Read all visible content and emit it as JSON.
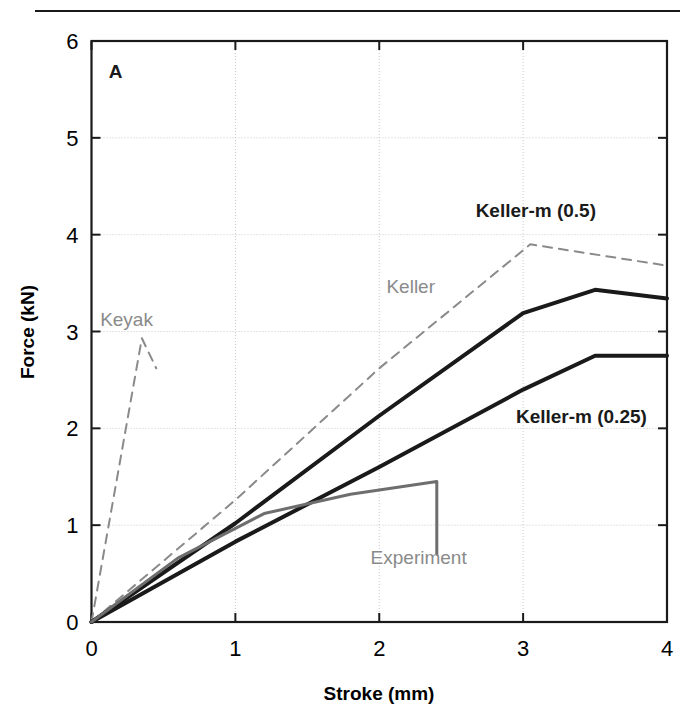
{
  "figure": {
    "panel_label": "A",
    "has_top_rule": true,
    "background_color": "#ffffff"
  },
  "chart_data": {
    "type": "line",
    "title": "",
    "subtitle": "",
    "xlabel": "Stroke (mm)",
    "ylabel": "Force (kN)",
    "xlim": [
      0,
      4
    ],
    "ylim": [
      0,
      6
    ],
    "xticks": [
      "0",
      "1",
      "2",
      "3",
      "4"
    ],
    "xtick_values": [
      0,
      1,
      2,
      3,
      4
    ],
    "yticks": [
      "0",
      "1",
      "2",
      "3",
      "4",
      "5",
      "6"
    ],
    "ytick_values": [
      0,
      1,
      2,
      3,
      4,
      5,
      6
    ],
    "grid": true,
    "grid_style": "dotted",
    "legend": "inline-annotations",
    "annotations": [
      {
        "text": "A",
        "x": 0.12,
        "y": 5.62,
        "style": "bold-dark"
      },
      {
        "text": "Keyak",
        "x": 0.06,
        "y": 3.06,
        "style": "gray"
      },
      {
        "text": "Keller",
        "x": 2.05,
        "y": 3.4,
        "style": "gray"
      },
      {
        "text": "Keller-m (0.5)",
        "x": 2.67,
        "y": 4.18,
        "style": "bold-dark"
      },
      {
        "text": "Keller-m (0.25)",
        "x": 2.95,
        "y": 2.05,
        "style": "bold-dark"
      },
      {
        "text": "Experiment",
        "x": 1.94,
        "y": 0.6,
        "style": "gray"
      }
    ],
    "series": [
      {
        "name": "Keyak",
        "color": "#8a8a8a",
        "line_style": "dashed",
        "line_width": 2,
        "points": [
          [
            0,
            0
          ],
          [
            0.35,
            2.93
          ],
          [
            0.45,
            2.62
          ]
        ]
      },
      {
        "name": "Keller",
        "color": "#8a8a8a",
        "line_style": "dashed",
        "line_width": 2,
        "points": [
          [
            0,
            0
          ],
          [
            1.0,
            1.26
          ],
          [
            2.0,
            2.62
          ],
          [
            3.05,
            3.9
          ],
          [
            4.0,
            3.68
          ]
        ]
      },
      {
        "name": "Keller-m (0.5)",
        "color": "#1a1a1a",
        "line_style": "solid",
        "line_width": 4,
        "points": [
          [
            0,
            0
          ],
          [
            1.0,
            1.02
          ],
          [
            2.0,
            2.13
          ],
          [
            3.0,
            3.19
          ],
          [
            3.5,
            3.43
          ],
          [
            4.0,
            3.34
          ]
        ]
      },
      {
        "name": "Keller-m (0.25)",
        "color": "#1a1a1a",
        "line_style": "solid",
        "line_width": 4,
        "points": [
          [
            0,
            0
          ],
          [
            1.0,
            0.83
          ],
          [
            2.0,
            1.6
          ],
          [
            3.0,
            2.4
          ],
          [
            3.5,
            2.75
          ],
          [
            4.0,
            2.75
          ]
        ]
      },
      {
        "name": "Experiment",
        "color": "#6e6e6e",
        "line_style": "solid",
        "line_width": 3,
        "points": [
          [
            0,
            0
          ],
          [
            0.6,
            0.66
          ],
          [
            1.2,
            1.12
          ],
          [
            1.8,
            1.32
          ],
          [
            2.4,
            1.45
          ],
          [
            2.4,
            0.7
          ]
        ]
      }
    ]
  }
}
